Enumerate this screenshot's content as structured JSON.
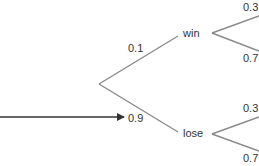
{
  "tree": {
    "root_branches": [
      {
        "probability": "0.1",
        "outcome": "win"
      },
      {
        "probability": "0.9",
        "outcome": "lose"
      }
    ],
    "win_branches": [
      {
        "probability": "0.3"
      },
      {
        "probability": "0.7"
      }
    ],
    "lose_branches": [
      {
        "probability": "0.3"
      },
      {
        "probability": "0.7"
      }
    ]
  },
  "colors": {
    "branch_line": "#8a8a8a",
    "arrow": "#333333",
    "text": "#333333"
  }
}
